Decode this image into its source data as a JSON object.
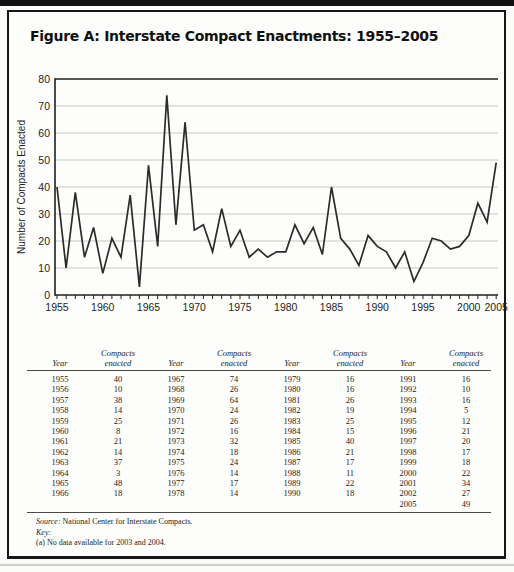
{
  "colors": {
    "ink": "#1f1f1f",
    "grid": "#c7c7c7",
    "line": "#2b2b2b",
    "box_border": "#161616"
  },
  "figure": {
    "title": "Figure A: Interstate Compact Enactments: 1955–2005"
  },
  "chart_data": {
    "type": "line",
    "title": "Figure A: Interstate Compact Enactments: 1955–2005",
    "xlabel": "",
    "ylabel": "Number of Compacts Enacted",
    "ylim": [
      0,
      80
    ],
    "yticks": [
      0,
      10,
      20,
      30,
      40,
      50,
      60,
      70,
      80
    ],
    "xtick_labels": [
      "1955",
      "1960",
      "1965",
      "1970",
      "1975",
      "1980",
      "1985",
      "1990",
      "1995",
      "2000",
      "2005"
    ],
    "grid": "horizontal",
    "legend": "none",
    "missing_years": [
      2003,
      2004
    ],
    "x": [
      1955,
      1956,
      1957,
      1958,
      1959,
      1960,
      1961,
      1962,
      1963,
      1964,
      1965,
      1966,
      1967,
      1968,
      1969,
      1970,
      1971,
      1972,
      1973,
      1974,
      1975,
      1976,
      1977,
      1978,
      1979,
      1980,
      1981,
      1982,
      1983,
      1984,
      1985,
      1986,
      1987,
      1988,
      1989,
      1990,
      1991,
      1992,
      1993,
      1994,
      1995,
      1996,
      1997,
      1998,
      1999,
      2000,
      2001,
      2002,
      2005
    ],
    "values": [
      40,
      10,
      38,
      14,
      25,
      8,
      21,
      14,
      37,
      3,
      48,
      18,
      74,
      26,
      64,
      24,
      26,
      16,
      32,
      18,
      24,
      14,
      17,
      14,
      16,
      16,
      26,
      19,
      25,
      15,
      40,
      21,
      17,
      11,
      22,
      18,
      16,
      10,
      16,
      5,
      12,
      21,
      20,
      17,
      18,
      22,
      34,
      27,
      49
    ]
  },
  "table": {
    "header": {
      "year": "Year",
      "value": "Compacts enacted"
    },
    "groups": [
      {
        "rows": [
          [
            "1955",
            "40"
          ],
          [
            "1956",
            "10"
          ],
          [
            "1957",
            "38"
          ],
          [
            "1958",
            "14"
          ],
          [
            "1959",
            "25"
          ],
          [
            "1960",
            "8"
          ],
          [
            "1961",
            "21"
          ],
          [
            "1962",
            "14"
          ],
          [
            "1963",
            "37"
          ],
          [
            "1964",
            "3"
          ],
          [
            "1965",
            "48"
          ],
          [
            "1966",
            "18"
          ]
        ]
      },
      {
        "rows": [
          [
            "1967",
            "74"
          ],
          [
            "1968",
            "26"
          ],
          [
            "1969",
            "64"
          ],
          [
            "1970",
            "24"
          ],
          [
            "1971",
            "26"
          ],
          [
            "1972",
            "16"
          ],
          [
            "1973",
            "32"
          ],
          [
            "1974",
            "18"
          ],
          [
            "1975",
            "24"
          ],
          [
            "1976",
            "14"
          ],
          [
            "1977",
            "17"
          ],
          [
            "1978",
            "14"
          ]
        ]
      },
      {
        "rows": [
          [
            "1979",
            "16"
          ],
          [
            "1980",
            "16"
          ],
          [
            "1981",
            "26"
          ],
          [
            "1982",
            "19"
          ],
          [
            "1983",
            "25"
          ],
          [
            "1984",
            "15"
          ],
          [
            "1985",
            "40"
          ],
          [
            "1986",
            "21"
          ],
          [
            "1987",
            "17"
          ],
          [
            "1988",
            "11"
          ],
          [
            "1989",
            "22"
          ],
          [
            "1990",
            "18"
          ]
        ]
      },
      {
        "rows": [
          [
            "1991",
            "16"
          ],
          [
            "1992",
            "10"
          ],
          [
            "1993",
            "16"
          ],
          [
            "1994",
            "5"
          ],
          [
            "1995",
            "12"
          ],
          [
            "1996",
            "21"
          ],
          [
            "1997",
            "20"
          ],
          [
            "1998",
            "17"
          ],
          [
            "1999",
            "18"
          ],
          [
            "2000",
            "22"
          ],
          [
            "2001",
            "34"
          ],
          [
            "2002",
            "27"
          ],
          [
            "2005",
            "49"
          ]
        ]
      }
    ]
  },
  "footer": {
    "source_label": "Source:",
    "source_text": " National Center for Interstate Compacts.",
    "key_label": "Key:",
    "key_note": "(a) No data available for 2003 and 2004."
  }
}
